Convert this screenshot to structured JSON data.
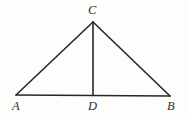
{
  "figure": {
    "name": "triangle-with-altitude",
    "background_color": "#fdfdfc",
    "line_color": "#272727",
    "label_color": "#2b2b2b",
    "canvas": {
      "width": 188,
      "height": 118
    },
    "points": [
      {
        "id": "A",
        "label": "A",
        "x": 16,
        "y": 95,
        "label_x": 12,
        "label_y": 100
      },
      {
        "id": "B",
        "label": "B",
        "x": 170,
        "y": 96,
        "label_x": 167,
        "label_y": 100
      },
      {
        "id": "C",
        "label": "C",
        "x": 93,
        "y": 22,
        "label_x": 88,
        "label_y": 4
      },
      {
        "id": "D",
        "label": "D",
        "x": 93,
        "y": 95,
        "label_x": 88,
        "label_y": 100
      }
    ],
    "segments": [
      {
        "id": "AB",
        "name": "base-segment-ab",
        "from": "A",
        "to": "B"
      },
      {
        "id": "AC",
        "name": "left-side-segment-ac",
        "from": "A",
        "to": "C"
      },
      {
        "id": "CB",
        "name": "right-side-segment-cb",
        "from": "C",
        "to": "B"
      },
      {
        "id": "CD",
        "name": "altitude-segment-cd",
        "from": "C",
        "to": "D"
      }
    ]
  }
}
